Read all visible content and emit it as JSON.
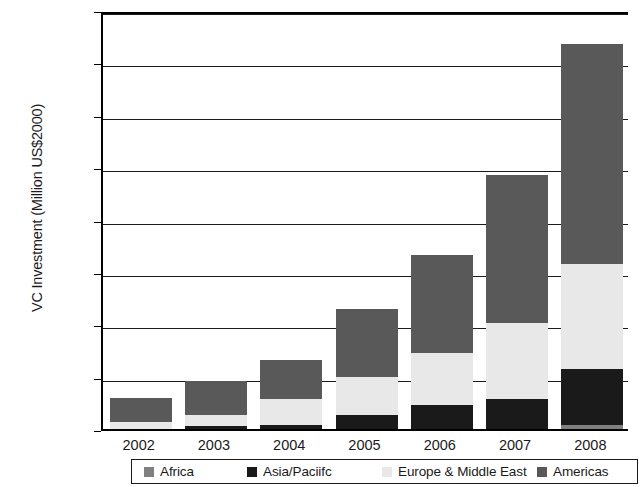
{
  "chart_data": {
    "type": "bar",
    "stacked": true,
    "title": "",
    "xlabel": "",
    "ylabel": "VC Investment (Million US$2000)",
    "ylim": [
      0,
      16
    ],
    "yticks": [
      0,
      2,
      4,
      6,
      8,
      10,
      12,
      14,
      16
    ],
    "grid": true,
    "legend_position": "bottom",
    "categories": [
      "2002",
      "2003",
      "2004",
      "2005",
      "2006",
      "2007",
      "2008"
    ],
    "series": [
      {
        "name": "Africa",
        "color": "#808080",
        "values": [
          0.0,
          0.0,
          0.0,
          0.0,
          0.0,
          0.0,
          0.15
        ]
      },
      {
        "name": "Asia/Paciifc",
        "color": "#1a1a1a",
        "values": [
          0.0,
          0.1,
          0.17,
          0.55,
          0.9,
          1.15,
          2.15
        ]
      },
      {
        "name": "Europe & Middle East",
        "color": "#e8e8e8",
        "values": [
          0.25,
          0.45,
          0.98,
          1.45,
          2.0,
          2.9,
          4.0
        ]
      },
      {
        "name": "Americas",
        "color": "#595959",
        "values": [
          0.95,
          1.3,
          1.5,
          2.6,
          3.75,
          5.65,
          8.4
        ]
      }
    ],
    "totals": [
      1.2,
      1.85,
      2.65,
      4.6,
      6.65,
      9.7,
      14.7
    ]
  },
  "legend": {
    "items": [
      {
        "label": "Africa",
        "icon": "square-swatch-icon"
      },
      {
        "label": "Asia/Paciifc",
        "icon": "square-swatch-icon"
      },
      {
        "label": "Europe & Middle East",
        "icon": "square-swatch-icon"
      },
      {
        "label": "Americas",
        "icon": "square-swatch-icon"
      }
    ]
  },
  "axis": {
    "y_title": "VC Investment (Million US$2000)",
    "y_tick_labels": [
      "0",
      "2",
      "4",
      "6",
      "8",
      "10",
      "12",
      "14",
      "16"
    ],
    "x_tick_labels": [
      "2002",
      "2003",
      "2004",
      "2005",
      "2006",
      "2007",
      "2008"
    ]
  }
}
